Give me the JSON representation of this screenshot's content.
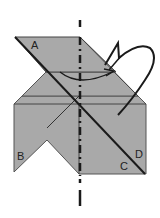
{
  "diagram": {
    "type": "origami-fold-instruction",
    "labels": {
      "a": "A",
      "b": "B",
      "c": "C",
      "d": "D"
    },
    "colors": {
      "paper": "#a9a9a9",
      "line": "#1a1a1a",
      "background": "#ffffff"
    },
    "fold_line": "valley-fold dashed vertical center line",
    "arrow": "curved fold-over arrow"
  }
}
